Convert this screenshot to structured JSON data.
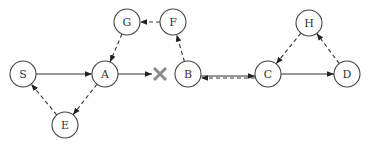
{
  "diagram": {
    "type": "directed-graph",
    "node_radius": 13,
    "colors": {
      "stroke": "#444444",
      "fill": "#ffffff",
      "cross": "#8a8a8a"
    },
    "nodes": [
      {
        "id": "S",
        "label": "S",
        "x": 23,
        "y": 74
      },
      {
        "id": "A",
        "label": "A",
        "x": 105,
        "y": 74
      },
      {
        "id": "G",
        "label": "G",
        "x": 127,
        "y": 22
      },
      {
        "id": "F",
        "label": "F",
        "x": 173,
        "y": 22
      },
      {
        "id": "E",
        "label": "E",
        "x": 65,
        "y": 125
      },
      {
        "id": "B",
        "label": "B",
        "x": 188,
        "y": 74
      },
      {
        "id": "C",
        "label": "C",
        "x": 268,
        "y": 74
      },
      {
        "id": "D",
        "label": "D",
        "x": 347,
        "y": 74
      },
      {
        "id": "H",
        "label": "H",
        "x": 309,
        "y": 23
      }
    ],
    "edges": [
      {
        "from": "S",
        "to": "A",
        "style": "solid"
      },
      {
        "from": "A",
        "to": "X",
        "style": "solid",
        "note": "blocked"
      },
      {
        "from": "A",
        "to": "E",
        "style": "dashed"
      },
      {
        "from": "E",
        "to": "S",
        "style": "dashed"
      },
      {
        "from": "G",
        "to": "A",
        "style": "dashed"
      },
      {
        "from": "F",
        "to": "G",
        "style": "dashed"
      },
      {
        "from": "B",
        "to": "F",
        "style": "dashed"
      },
      {
        "from": "B",
        "to": "C",
        "style": "solid"
      },
      {
        "from": "C",
        "to": "B",
        "style": "dashed"
      },
      {
        "from": "C",
        "to": "D",
        "style": "solid"
      },
      {
        "from": "D",
        "to": "H",
        "style": "dashed"
      },
      {
        "from": "H",
        "to": "C",
        "style": "dashed"
      }
    ],
    "blocked_marker": {
      "symbol": "cross",
      "x": 160,
      "y": 74
    }
  }
}
